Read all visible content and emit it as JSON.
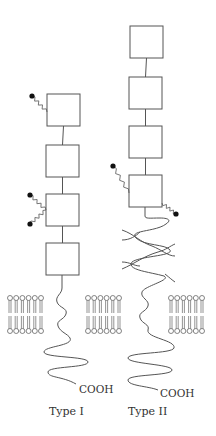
{
  "diagram": {
    "types": [
      {
        "id": "type-1",
        "label": "Type I",
        "c_terminus_label": "COOH",
        "extracellular_domains": 4,
        "glycosylation_sites": [
          {
            "domain": 1,
            "side": "left",
            "chains": 1
          },
          {
            "domain": 3,
            "side": "left",
            "chains": 2
          }
        ],
        "transmembrane_segment": "single helix",
        "stalk": "none"
      },
      {
        "id": "type-2",
        "label": "Type II",
        "c_terminus_label": "COOH",
        "extracellular_domains": 4,
        "glycosylation_sites": [
          {
            "domain": 4,
            "side": "left",
            "chains": 1
          },
          {
            "domain": 4,
            "side": "right",
            "chains": 1
          }
        ],
        "transmembrane_segment": "single helix",
        "stalk": "coiled-coil"
      }
    ],
    "membrane": {
      "segments": 3,
      "lipids_per_leaflet": 6
    },
    "colors": {
      "stroke": "#555555",
      "glycan_dot": "#111111",
      "background": "#ffffff"
    }
  }
}
